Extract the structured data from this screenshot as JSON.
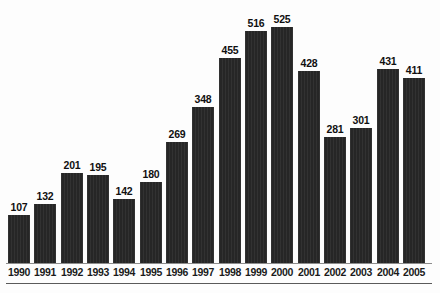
{
  "chart_data": {
    "type": "bar",
    "title": "",
    "subtitle": "",
    "xlabel": "",
    "ylabel": "",
    "categories": [
      "1990",
      "1991",
      "1992",
      "1993",
      "1994",
      "1995",
      "1996",
      "1997",
      "1998",
      "1999",
      "2000",
      "2001",
      "2002",
      "2003",
      "2004",
      "2005"
    ],
    "values": [
      107,
      132,
      201,
      195,
      142,
      180,
      269,
      348,
      455,
      516,
      525,
      428,
      281,
      301,
      431,
      411
    ],
    "data_labels": [
      "107",
      "132",
      "201",
      "195",
      "142",
      "180",
      "269",
      "348",
      "455",
      "516",
      "525",
      "428",
      "281",
      "301",
      "431",
      "411"
    ],
    "ylim": [
      0,
      525
    ],
    "grid": false,
    "legend": null,
    "axis": {
      "x_axis_visible": true,
      "y_axis_visible": false,
      "y_ticks_visible": false
    },
    "series_color": "#262626"
  },
  "figure": {
    "background_color": "#fdfdfd",
    "axis_line_color": "#8d8d8d",
    "footer_rule_color": "#5a5a5a",
    "caption_text": ""
  }
}
